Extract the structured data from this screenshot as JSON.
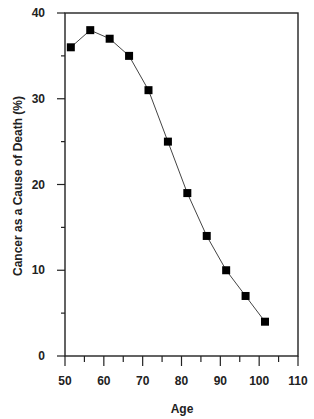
{
  "chart_data": {
    "type": "line",
    "title": "",
    "xlabel": "Age",
    "ylabel": "Cancer as a Cause of Death (%)",
    "xlim": [
      50,
      110
    ],
    "ylim": [
      0,
      40
    ],
    "x_ticks": [
      50,
      60,
      70,
      80,
      90,
      100,
      110
    ],
    "y_ticks": [
      0,
      10,
      20,
      30,
      40
    ],
    "x_minor_step": 5,
    "y_minor_step": 5,
    "grid": false,
    "legend": null,
    "marker": "square",
    "series": [
      {
        "name": "Cancer as a Cause of Death",
        "x": [
          51.5,
          56.5,
          61.5,
          66.5,
          71.5,
          76.5,
          81.5,
          86.5,
          91.5,
          96.5,
          101.5
        ],
        "values": [
          36,
          38,
          37,
          35,
          31,
          25,
          19,
          14,
          10,
          7,
          4
        ]
      }
    ]
  },
  "colors": {
    "line": "#444444",
    "marker": "#000000",
    "axis": "#222222",
    "background": "#ffffff"
  }
}
